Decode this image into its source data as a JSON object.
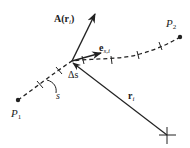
{
  "diagram": {
    "colors": {
      "background": "#ffffff",
      "stroke": "#222222"
    },
    "labels": {
      "vector_field": "A(r",
      "vector_field_sub": "i",
      "vector_field_close": ")",
      "unit_tangent": "e",
      "unit_tangent_sub": "s,i",
      "position_vector": "r",
      "position_vector_sub": "i",
      "segment": "Δs",
      "arc_length": "s",
      "start_point": "P",
      "start_point_sub": "1",
      "end_point": "P",
      "end_point_sub": "2"
    },
    "points": {
      "P1": [
        18,
        100
      ],
      "P2": [
        180,
        37
      ],
      "junction": [
        72,
        61
      ],
      "origin": [
        167,
        135
      ]
    }
  }
}
